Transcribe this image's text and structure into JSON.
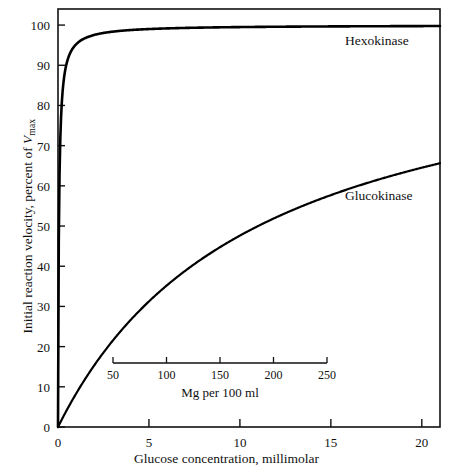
{
  "chart_data": {
    "type": "line",
    "title": "",
    "xlabel": "Glucose concentration, millimolar",
    "ylabel": "Initial reaction velocity, percent of Vmax",
    "ylabel_parts": {
      "prefix": "Initial reaction velocity, percent of ",
      "symbol": "V",
      "subscript": "max"
    },
    "xlim": [
      0,
      21
    ],
    "ylim": [
      0,
      104
    ],
    "grid": false,
    "legend_position": "inline-right",
    "x_ticks": [
      0,
      5,
      10,
      15,
      20
    ],
    "x_tick_labels": [
      "0",
      "5",
      "10",
      "15",
      "20"
    ],
    "y_ticks": [
      0,
      10,
      20,
      30,
      40,
      50,
      60,
      70,
      80,
      90,
      100
    ],
    "y_tick_labels": [
      "0",
      "10",
      "20",
      "30",
      "40",
      "50",
      "60",
      "70",
      "80",
      "90",
      "100"
    ],
    "series": [
      {
        "name": "Hexokinase",
        "model": "michaelis-menten",
        "km_millimolar": 0.05,
        "vmax_percent": 100,
        "x": [
          0,
          0.05,
          0.1,
          0.2,
          0.3,
          0.5,
          0.75,
          1,
          1.5,
          2,
          3,
          5,
          7.5,
          10,
          15,
          20,
          21
        ],
        "values": [
          0,
          50,
          67,
          80,
          86,
          91,
          94,
          95.5,
          97,
          97.5,
          98,
          98.4,
          98.8,
          99.1,
          99.5,
          99.9,
          100
        ]
      },
      {
        "name": "Glucokinase",
        "model": "michaelis-menten",
        "km_millimolar": 11,
        "vmax_percent": 100,
        "x": [
          0,
          0.5,
          1,
          2,
          3,
          4,
          5,
          6,
          7,
          8,
          9,
          10,
          11,
          12,
          13,
          14,
          15,
          16,
          17,
          18,
          19,
          20,
          21
        ],
        "values": [
          0,
          4.3,
          8.3,
          15.4,
          21.4,
          26.7,
          31.3,
          35.3,
          38.9,
          42.1,
          45.0,
          47.6,
          50.0,
          52.2,
          54.2,
          56.0,
          57.7,
          59.3,
          60.7,
          62.1,
          63.3,
          64.5,
          65.6
        ]
      }
    ],
    "inset_axis": {
      "label": "Mg per 100 ml",
      "ticks": [
        50,
        100,
        150,
        200,
        250
      ],
      "tick_labels": [
        "50",
        "100",
        "150",
        "200",
        "250"
      ],
      "range_millimolar": [
        2.78,
        13.88
      ]
    },
    "annotations": [
      {
        "text": "Hexokinase",
        "series": "Hexokinase"
      },
      {
        "text": "Glucokinase",
        "series": "Glucokinase"
      }
    ]
  },
  "style": {
    "axis_color": "#111111",
    "curve_color": "#000000",
    "background": "#ffffff"
  }
}
